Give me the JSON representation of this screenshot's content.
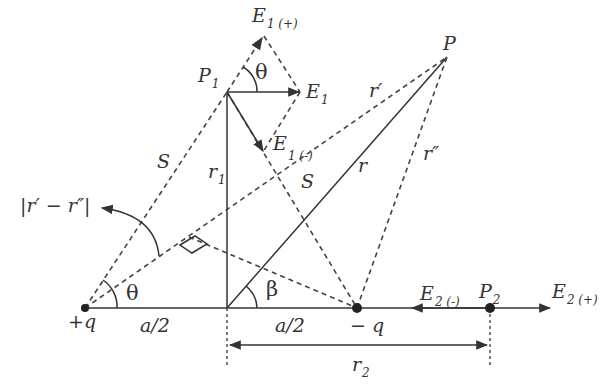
{
  "diagram": {
    "charges": {
      "positive": "+q",
      "negative": "− q"
    },
    "points": {
      "P": "P",
      "P1": "P",
      "P1_sub": "1",
      "P2": "P",
      "P2_sub": "2"
    },
    "vectors": {
      "E1": "E",
      "E1_sub": "1",
      "E1_plus": "E",
      "E1_plus_sub": "1 (+)",
      "E1_minus": "E",
      "E1_minus_sub": "1 (-)",
      "E2_plus": "E",
      "E2_plus_sub": "2 (+)",
      "E2_minus": "E",
      "E2_minus_sub": "2 (-)"
    },
    "distances": {
      "S_left": "S",
      "S_right": "S",
      "r1": "r",
      "r1_sub": "1",
      "r_main": "r",
      "r_prime": "r′",
      "r_double_prime": "r″",
      "r_diff": "|r′ − r″|",
      "half_a_left": "a/2",
      "half_a_right": "a/2",
      "r2": "r",
      "r2_sub": "2"
    },
    "angles": {
      "theta_top": "θ",
      "theta_bottom": "θ",
      "beta": "β"
    }
  }
}
